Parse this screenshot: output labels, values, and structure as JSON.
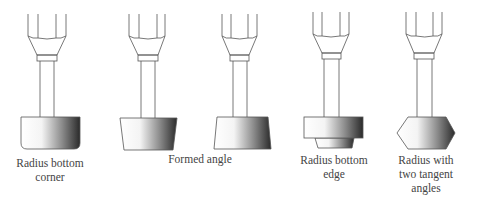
{
  "diagram": {
    "type": "tool-profile-illustration",
    "tools": [
      {
        "id": "tool-1",
        "label": "Radius bottom corner",
        "label_lines": [
          "Radius bottom",
          "corner"
        ],
        "shape": "rounded-bottom-corner"
      },
      {
        "id": "tool-2",
        "shape": "formed-angle-taper-left"
      },
      {
        "id": "tool-3",
        "shape": "formed-angle-taper-right"
      },
      {
        "id": "tool-4",
        "label": "Radius bottom edge",
        "label_lines": [
          "Radius bottom",
          "edge"
        ],
        "shape": "stepped-bottom-edge"
      },
      {
        "id": "tool-5",
        "label": "Radius with two tangent angles",
        "label_lines": [
          "Radius with",
          "two tangent",
          "angles"
        ],
        "shape": "double-angle-point"
      }
    ],
    "shared_labels": [
      {
        "label": "Formed angle",
        "applies_to": [
          "tool-2",
          "tool-3"
        ]
      }
    ],
    "colors": {
      "stroke": "#555555",
      "gradient_light": "#ffffff",
      "gradient_dark": "#2a2a2a",
      "text": "#444444"
    }
  }
}
